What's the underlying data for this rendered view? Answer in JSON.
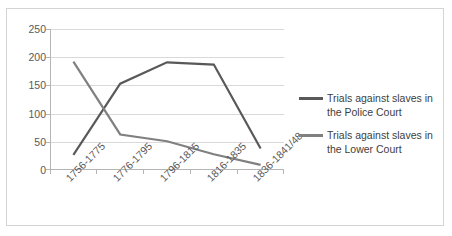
{
  "chart_data": {
    "type": "line",
    "title": "",
    "xlabel": "",
    "ylabel": "",
    "ylim": [
      0,
      250
    ],
    "yticks": [
      0,
      50,
      100,
      150,
      200,
      250
    ],
    "grid": true,
    "legend_position": "right",
    "categories": [
      "1756-1775",
      "1776-1795",
      "1796-1815",
      "1816-1835",
      "1836-1841/48"
    ],
    "series": [
      {
        "name": "Trials against slaves in the Police Court",
        "color": "#595959",
        "values": [
          27,
          153,
          191,
          187,
          38
        ]
      },
      {
        "name": "Trials against slaves in the Lower Court",
        "color": "#808080",
        "values": [
          192,
          63,
          51,
          28,
          9
        ]
      }
    ]
  },
  "axes": {
    "y_tick_labels": [
      "250",
      "200",
      "150",
      "100",
      "50",
      "0"
    ],
    "x_tick_labels": [
      "1756-1775",
      "1776-1795",
      "1796-1815",
      "1816-1835",
      "1836-1841/48"
    ]
  },
  "legend": {
    "entries": [
      {
        "label": "Trials against slaves in the Police Court",
        "color": "#595959"
      },
      {
        "label": "Trials against slaves in the Lower Court",
        "color": "#808080"
      }
    ]
  }
}
